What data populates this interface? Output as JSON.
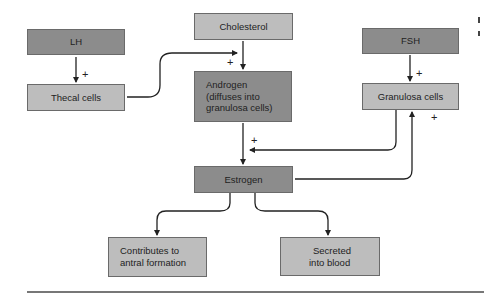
{
  "diagram": {
    "nodes": {
      "lh": "LH",
      "thecal": "Thecal cells",
      "cholesterol": "Cholesterol",
      "androgen_line1": "Androgen",
      "androgen_line2": "(diffuses into",
      "androgen_line3": "granulosa cells)",
      "fsh": "FSH",
      "granulosa": "Granulosa cells",
      "estrogen": "Estrogen",
      "antral_line1": "Contributes to",
      "antral_line2": "antral formation",
      "blood_line1": "Secreted",
      "blood_line2": "into blood"
    },
    "signs": {
      "lh_to_thecal": "+",
      "thecal_to_androgen": "+",
      "fsh_to_granulosa": "+",
      "granulosa_to_estrogen": "+",
      "estrogen_to_granulosa": "+"
    },
    "edges": [
      {
        "from": "LH",
        "to": "Thecal cells",
        "sign": "+"
      },
      {
        "from": "Thecal cells",
        "to": "Androgen",
        "sign": "+"
      },
      {
        "from": "Cholesterol",
        "to": "Androgen",
        "sign": ""
      },
      {
        "from": "FSH",
        "to": "Granulosa cells",
        "sign": "+"
      },
      {
        "from": "Androgen",
        "to": "Estrogen",
        "sign": ""
      },
      {
        "from": "Granulosa cells",
        "to": "Estrogen",
        "sign": "+"
      },
      {
        "from": "Estrogen",
        "to": "Granulosa cells",
        "sign": "+"
      },
      {
        "from": "Estrogen",
        "to": "Contributes to antral formation",
        "sign": ""
      },
      {
        "from": "Estrogen",
        "to": "Secreted into blood",
        "sign": ""
      }
    ],
    "colors": {
      "dark_box": "#8c8c8c",
      "light_box": "#bdbdbd",
      "line": "#222222"
    }
  }
}
